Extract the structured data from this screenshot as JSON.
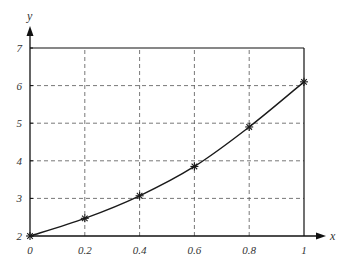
{
  "chart_data": {
    "type": "line",
    "title": "",
    "xlabel": "x",
    "ylabel": "y",
    "xlim": [
      0,
      1
    ],
    "ylim": [
      2,
      7
    ],
    "grid": true,
    "grid_style": "dashed",
    "x_ticks": [
      "0",
      "0.2",
      "0.4",
      "0.6",
      "0.8",
      "1"
    ],
    "y_ticks": [
      "2",
      "3",
      "4",
      "5",
      "6",
      "7"
    ],
    "x": [
      0,
      0.2,
      0.4,
      0.6,
      0.8,
      1.0
    ],
    "series": [
      {
        "name": "y",
        "marker": "asterisk",
        "values": [
          2.0,
          2.47,
          3.07,
          3.85,
          4.9,
          6.1
        ]
      }
    ],
    "legend": null
  },
  "colors": {
    "line": "#1a1a1a",
    "grid": "#555555",
    "axis": "#111111",
    "text": "#333333"
  }
}
